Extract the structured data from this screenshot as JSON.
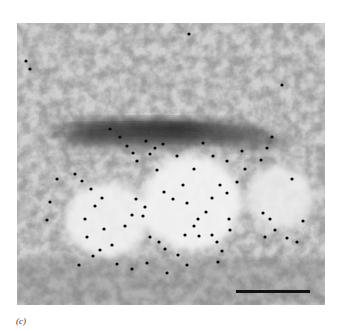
{
  "figure": {
    "panel_label": "(c)",
    "image_type": "electron micrograph with immunogold labeling",
    "features": [
      "dense filament band",
      "vesicles",
      "gold particles",
      "scale bar"
    ],
    "colors": {
      "background": "#ffffff",
      "particle": "#0a0a0a",
      "scale_bar": "#111111"
    }
  }
}
